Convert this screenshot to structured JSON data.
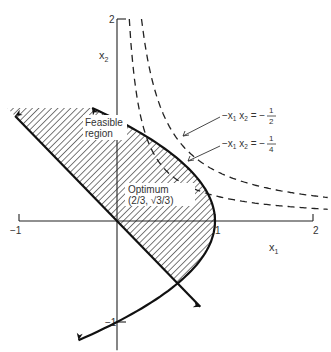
{
  "figure": {
    "type": "feasible-region-diagram",
    "axes": {
      "x_label": "x",
      "x_label_sub": "1",
      "y_label": "x",
      "y_label_sub": "2",
      "x_ticks": [
        {
          "value": -1,
          "label": "−1"
        },
        {
          "value": 1,
          "label": "1"
        },
        {
          "value": 2,
          "label": "2"
        }
      ],
      "y_ticks": [
        {
          "value": 2,
          "label": "2"
        },
        {
          "value": 1,
          "label": "1"
        },
        {
          "value": -1,
          "label": "−1"
        }
      ],
      "x_range": [
        -1,
        2
      ],
      "y_range": [
        -1.2,
        2
      ]
    },
    "constraints": [
      {
        "name": "parabola",
        "equation": "x1 = 1 - x2^2",
        "x2_range": [
          -1.18,
          1.12
        ]
      },
      {
        "name": "line",
        "equation": "x1 + x2 = 0",
        "x1_range": [
          -1.04,
          0.85
        ]
      }
    ],
    "level_curves": [
      {
        "equation": "-x1 x2 = -1/2",
        "k": 0.5
      },
      {
        "equation": "-x1 x2 = -1/4",
        "k": 0.25
      }
    ],
    "labels": {
      "feasible_line1": "Feasible",
      "feasible_line2": "region",
      "optimum_line1": "Optimum",
      "optimum_line2": "(2/3, √3/3)",
      "curve_half_lhs": "−x",
      "curve_half_s1": "1",
      "curve_half_mid": " x",
      "curve_half_s2": "2",
      "curve_half_eq": " = −",
      "curve_half_num": "1",
      "curve_half_den": "2",
      "curve_quarter_lhs": "−x",
      "curve_quarter_s1": "1",
      "curve_quarter_mid": " x",
      "curve_quarter_s2": "2",
      "curve_quarter_eq": " = −",
      "curve_quarter_num": "1",
      "curve_quarter_den": "4"
    },
    "optimum": {
      "x1": 0.6667,
      "x2": 0.5774
    }
  }
}
